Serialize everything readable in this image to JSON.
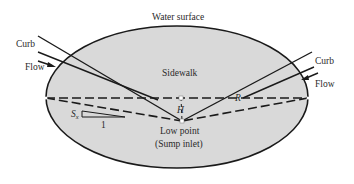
{
  "diagram": {
    "title_label": "Water surface",
    "region_label": "Sidewalk",
    "left_curb_label": "Curb",
    "left_flow_label": "Flow",
    "right_curb_label": "Curb",
    "right_flow_label": "Flow",
    "depth_label": "H",
    "spread_label": "R",
    "slope_label_s": "S",
    "slope_label_sub": "x",
    "slope_run_label": "1",
    "low_point_label_1": "Low point",
    "low_point_label_2": "(Sump inlet)",
    "colors": {
      "fill": "#d9d9d9",
      "stroke": "#1a1a1a",
      "background": "#ffffff"
    }
  }
}
